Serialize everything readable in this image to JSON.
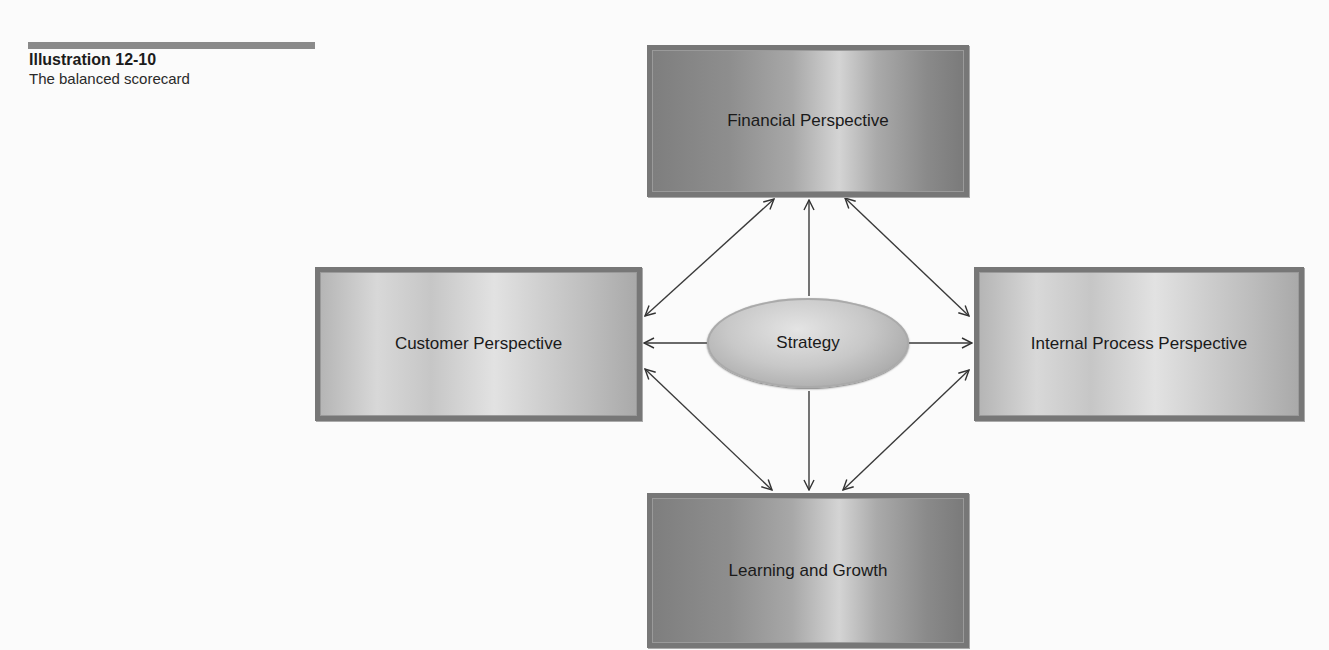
{
  "caption": {
    "title": "Illustration 12-10",
    "subtitle": "The balanced scorecard"
  },
  "diagram": {
    "center": {
      "label": "Strategy"
    },
    "perspectives": [
      {
        "id": "financial",
        "label": "Financial Perspective",
        "position": "top"
      },
      {
        "id": "customer",
        "label": "Customer Perspective",
        "position": "left"
      },
      {
        "id": "internal",
        "label": "Internal Process Perspective",
        "position": "right"
      },
      {
        "id": "learning",
        "label": "Learning and Growth",
        "position": "bottom"
      }
    ],
    "connections": [
      {
        "from": "strategy",
        "to": "financial",
        "type": "one-way"
      },
      {
        "from": "strategy",
        "to": "customer",
        "type": "one-way"
      },
      {
        "from": "strategy",
        "to": "internal",
        "type": "one-way"
      },
      {
        "from": "strategy",
        "to": "learning",
        "type": "one-way"
      },
      {
        "from": "financial",
        "to": "customer",
        "type": "two-way"
      },
      {
        "from": "financial",
        "to": "internal",
        "type": "two-way"
      },
      {
        "from": "customer",
        "to": "learning",
        "type": "two-way"
      },
      {
        "from": "internal",
        "to": "learning",
        "type": "two-way"
      }
    ]
  }
}
